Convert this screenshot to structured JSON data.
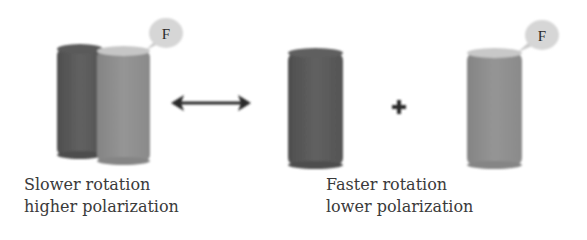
{
  "diagram": {
    "left_group": {
      "fluorophore_label": "F",
      "caption_line1": "Slower rotation",
      "caption_line2": "higher polarization"
    },
    "equilibrium_symbol": "double-arrow",
    "right_group": {
      "fluorophore_label": "F",
      "plus_symbol": "+",
      "caption_line1": "Faster rotation",
      "caption_line2": "lower polarization"
    },
    "colors": {
      "dark_cylinder": "#5c5c5c",
      "light_cylinder": "#8e8e8e",
      "light_cylinder_top": "#c8c8c8",
      "bubble": "#d6d6d6",
      "arrow": "#2a2a2a",
      "text": "#3a3a3a"
    }
  }
}
